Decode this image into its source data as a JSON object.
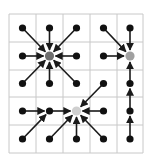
{
  "grid": {
    "cols": 5,
    "rows": 5,
    "x_lines": [
      9,
      36,
      63,
      90,
      117,
      143
    ],
    "y_lines": [
      14,
      42,
      70,
      97,
      125,
      153
    ],
    "line_color": "#c8c8c8"
  },
  "colors": {
    "node": "#111111",
    "edge": "#1a1a1a",
    "hub_dark": "#6e6e6e",
    "hub_mid": "#a0a0a0",
    "hub_light": "#cfcfcf"
  },
  "hubs": [
    {
      "id": "hub-a",
      "col": 1,
      "row": 1,
      "shade": "hub_dark"
    },
    {
      "id": "hub-b",
      "col": 4,
      "row": 1,
      "shade": "hub_mid"
    },
    {
      "id": "hub-c",
      "col": 2,
      "row": 3,
      "shade": "hub_light"
    }
  ],
  "nodes": [
    [
      0,
      0
    ],
    [
      1,
      0
    ],
    [
      2,
      0
    ],
    [
      3,
      0
    ],
    [
      4,
      0
    ],
    [
      0,
      1
    ],
    [
      2,
      1
    ],
    [
      3,
      1
    ],
    [
      0,
      2
    ],
    [
      1,
      2
    ],
    [
      2,
      2
    ],
    [
      3,
      2
    ],
    [
      4,
      2
    ],
    [
      0,
      3
    ],
    [
      1,
      3
    ],
    [
      3,
      3
    ],
    [
      4,
      3
    ],
    [
      0,
      4
    ],
    [
      1,
      4
    ],
    [
      2,
      4
    ],
    [
      3,
      4
    ],
    [
      4,
      4
    ]
  ],
  "edges": [
    {
      "from": [
        0,
        0
      ],
      "to": [
        1,
        1
      ]
    },
    {
      "from": [
        1,
        0
      ],
      "to": [
        1,
        1
      ]
    },
    {
      "from": [
        2,
        0
      ],
      "to": [
        1,
        1
      ]
    },
    {
      "from": [
        0,
        1
      ],
      "to": [
        1,
        1
      ]
    },
    {
      "from": [
        2,
        1
      ],
      "to": [
        1,
        1
      ]
    },
    {
      "from": [
        0,
        2
      ],
      "to": [
        1,
        1
      ]
    },
    {
      "from": [
        1,
        2
      ],
      "to": [
        1,
        1
      ]
    },
    {
      "from": [
        2,
        2
      ],
      "to": [
        1,
        1
      ]
    },
    {
      "from": [
        3,
        0
      ],
      "to": [
        4,
        1
      ]
    },
    {
      "from": [
        4,
        0
      ],
      "to": [
        4,
        1
      ]
    },
    {
      "from": [
        3,
        1
      ],
      "to": [
        4,
        1
      ]
    },
    {
      "from": [
        4,
        2
      ],
      "to": [
        4,
        1
      ]
    },
    {
      "from": [
        4,
        3
      ],
      "to": [
        4,
        2
      ]
    },
    {
      "from": [
        4,
        4
      ],
      "to": [
        4,
        3
      ]
    },
    {
      "from": [
        3,
        2
      ],
      "to": [
        2,
        3
      ]
    },
    {
      "from": [
        1,
        3
      ],
      "to": [
        2,
        3
      ]
    },
    {
      "from": [
        3,
        3
      ],
      "to": [
        2,
        3
      ]
    },
    {
      "from": [
        1,
        4
      ],
      "to": [
        2,
        3
      ]
    },
    {
      "from": [
        2,
        4
      ],
      "to": [
        2,
        3
      ]
    },
    {
      "from": [
        3,
        4
      ],
      "to": [
        2,
        3
      ]
    },
    {
      "from": [
        0,
        3
      ],
      "to": [
        1,
        3
      ]
    },
    {
      "from": [
        0,
        4
      ],
      "to": [
        1,
        3
      ]
    }
  ]
}
